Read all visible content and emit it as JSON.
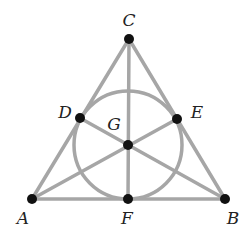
{
  "diagram": {
    "colors": {
      "line": "#a6a6a6",
      "point": "#111111",
      "label": "#222222",
      "background": "#ffffff"
    },
    "points": [
      {
        "id": "A",
        "x": 32,
        "y": 199,
        "label": "A",
        "lx": 23,
        "ly": 218
      },
      {
        "id": "B",
        "x": 225,
        "y": 199,
        "label": "B",
        "lx": 233,
        "ly": 218
      },
      {
        "id": "C",
        "x": 129,
        "y": 39,
        "label": "C",
        "lx": 129,
        "ly": 20
      },
      {
        "id": "D",
        "x": 80,
        "y": 118,
        "label": "D",
        "lx": 65,
        "ly": 112
      },
      {
        "id": "E",
        "x": 177,
        "y": 119,
        "label": "E",
        "lx": 197,
        "ly": 112
      },
      {
        "id": "F",
        "x": 128,
        "y": 199,
        "label": "F",
        "lx": 127,
        "ly": 218
      },
      {
        "id": "G",
        "x": 128,
        "y": 145,
        "label": "G",
        "lx": 114,
        "ly": 124
      }
    ],
    "lines": [
      [
        "A",
        "D",
        "C"
      ],
      [
        "C",
        "E",
        "B"
      ],
      [
        "A",
        "F",
        "B"
      ],
      [
        "C",
        "G",
        "F"
      ],
      [
        "A",
        "G",
        "E"
      ],
      [
        "B",
        "G",
        "D"
      ]
    ],
    "circle": {
      "through": [
        "D",
        "E",
        "F"
      ],
      "cx": 128,
      "cy": 145,
      "r": 54
    }
  }
}
